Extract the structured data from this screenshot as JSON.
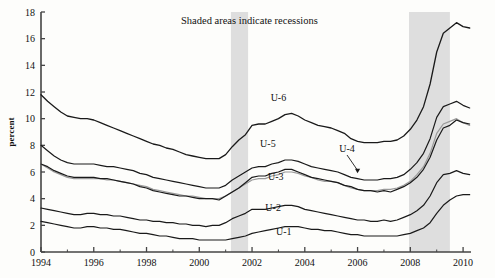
{
  "chart_data": {
    "type": "line",
    "title": "",
    "xlabel": "",
    "ylabel": "percent",
    "xlim": [
      1994.0,
      2010.3
    ],
    "ylim": [
      0,
      18
    ],
    "ytick_step": 2,
    "yticks": [
      0,
      2,
      4,
      6,
      8,
      10,
      12,
      14,
      16,
      18
    ],
    "xticks": [
      1994,
      1996,
      1998,
      2000,
      2002,
      2004,
      2006,
      2008,
      2010
    ],
    "xminor": [
      1995,
      1997,
      1999,
      2001,
      2003,
      2005,
      2007,
      2009
    ],
    "grid": false,
    "legend_position": "inline-labels",
    "annotations": [
      {
        "name": "recession-note",
        "text": "Shaded areas indicate recessions",
        "x": 2001.9,
        "y": 17.1
      },
      {
        "name": "label-u6",
        "text": "U-6",
        "x": 2003.0,
        "y": 11.3
      },
      {
        "name": "label-u5",
        "text": "U-5",
        "x": 2002.6,
        "y": 7.9
      },
      {
        "name": "label-u4",
        "text": "U-4",
        "x": 2005.6,
        "y": 7.5,
        "arrow_to": {
          "x": 2006.0,
          "y": 5.9
        }
      },
      {
        "name": "label-u3",
        "text": "U-3",
        "x": 2002.9,
        "y": 5.4
      },
      {
        "name": "label-u2",
        "text": "U-2",
        "x": 2002.8,
        "y": 3.1
      },
      {
        "name": "label-u1",
        "text": "U-1",
        "x": 2003.2,
        "y": 1.25
      }
    ],
    "shaded_regions": [
      {
        "name": "recession-2001",
        "x0": 2001.2,
        "x1": 2001.85,
        "color": "#dedede"
      },
      {
        "name": "recession-2008",
        "x0": 2007.95,
        "x1": 2009.5,
        "color": "#dedede"
      }
    ],
    "colors": {
      "dark_line": "#1a1a1a",
      "u4_line": "#9a9a9a",
      "shading": "#dedede",
      "axis": "#444444",
      "background": "#fdfdfb"
    },
    "x": [
      1994.0,
      1994.25,
      1994.5,
      1994.75,
      1995.0,
      1995.25,
      1995.5,
      1995.75,
      1996.0,
      1996.25,
      1996.5,
      1996.75,
      1997.0,
      1997.25,
      1997.5,
      1997.75,
      1998.0,
      1998.25,
      1998.5,
      1998.75,
      1999.0,
      1999.25,
      1999.5,
      1999.75,
      2000.0,
      2000.25,
      2000.5,
      2000.75,
      2001.0,
      2001.25,
      2001.5,
      2001.75,
      2002.0,
      2002.25,
      2002.5,
      2002.75,
      2003.0,
      2003.25,
      2003.5,
      2003.75,
      2004.0,
      2004.25,
      2004.5,
      2004.75,
      2005.0,
      2005.25,
      2005.5,
      2005.75,
      2006.0,
      2006.25,
      2006.5,
      2006.75,
      2007.0,
      2007.25,
      2007.5,
      2007.75,
      2008.0,
      2008.25,
      2008.5,
      2008.75,
      2009.0,
      2009.25,
      2009.5,
      2009.75,
      2010.0,
      2010.25
    ],
    "series": [
      {
        "name": "U-6",
        "label": "U-6",
        "color": "#1a1a1a",
        "width": 1.3,
        "values": [
          11.8,
          11.3,
          10.9,
          10.5,
          10.2,
          10.1,
          10.0,
          10.0,
          9.9,
          9.7,
          9.5,
          9.3,
          9.1,
          8.9,
          8.7,
          8.5,
          8.3,
          8.1,
          8.0,
          7.8,
          7.7,
          7.5,
          7.3,
          7.2,
          7.1,
          7.0,
          7.0,
          7.0,
          7.3,
          7.9,
          8.4,
          8.8,
          9.5,
          9.6,
          9.6,
          9.8,
          10.0,
          10.3,
          10.4,
          10.2,
          9.9,
          9.7,
          9.5,
          9.4,
          9.3,
          9.1,
          8.9,
          8.5,
          8.3,
          8.2,
          8.2,
          8.2,
          8.3,
          8.3,
          8.4,
          8.7,
          9.2,
          9.9,
          10.9,
          12.6,
          15.0,
          16.4,
          16.8,
          17.2,
          16.9,
          16.8
        ]
      },
      {
        "name": "U-5",
        "label": "U-5",
        "color": "#1a1a1a",
        "width": 1.2,
        "values": [
          8.0,
          7.6,
          7.2,
          6.9,
          6.7,
          6.6,
          6.6,
          6.6,
          6.6,
          6.5,
          6.4,
          6.4,
          6.3,
          6.2,
          6.1,
          5.9,
          5.8,
          5.6,
          5.5,
          5.4,
          5.3,
          5.2,
          5.1,
          5.0,
          4.9,
          4.8,
          4.8,
          4.8,
          5.0,
          5.4,
          5.7,
          6.0,
          6.3,
          6.4,
          6.4,
          6.6,
          6.7,
          6.9,
          6.9,
          6.8,
          6.6,
          6.4,
          6.3,
          6.2,
          6.1,
          6.0,
          5.8,
          5.6,
          5.5,
          5.4,
          5.4,
          5.4,
          5.5,
          5.5,
          5.6,
          5.8,
          6.2,
          6.7,
          7.4,
          8.5,
          10.1,
          10.9,
          11.1,
          11.3,
          11.0,
          10.8
        ]
      },
      {
        "name": "U-4",
        "label": "U-4",
        "color": "#9a9a9a",
        "width": 1.2,
        "values": [
          6.6,
          6.3,
          6.0,
          5.8,
          5.6,
          5.5,
          5.5,
          5.5,
          5.5,
          5.5,
          5.4,
          5.4,
          5.3,
          5.2,
          5.1,
          5.0,
          4.9,
          4.7,
          4.6,
          4.5,
          4.4,
          4.3,
          4.2,
          4.2,
          4.1,
          4.0,
          4.0,
          4.0,
          4.2,
          4.5,
          4.8,
          5.1,
          5.4,
          5.5,
          5.5,
          5.7,
          5.8,
          6.0,
          6.0,
          5.9,
          5.7,
          5.6,
          5.4,
          5.3,
          5.3,
          5.2,
          5.0,
          4.8,
          4.7,
          4.6,
          4.6,
          4.6,
          4.7,
          4.7,
          4.8,
          5.0,
          5.3,
          5.8,
          6.4,
          7.4,
          8.9,
          9.6,
          9.8,
          10.0,
          9.7,
          9.5
        ]
      },
      {
        "name": "U-3",
        "label": "U-3",
        "color": "#1a1a1a",
        "width": 1.2,
        "values": [
          6.6,
          6.4,
          6.1,
          5.9,
          5.7,
          5.6,
          5.6,
          5.6,
          5.6,
          5.5,
          5.5,
          5.4,
          5.3,
          5.2,
          5.1,
          4.9,
          4.8,
          4.6,
          4.5,
          4.4,
          4.3,
          4.2,
          4.2,
          4.1,
          4.0,
          4.0,
          4.0,
          3.9,
          4.2,
          4.5,
          4.8,
          5.2,
          5.6,
          5.7,
          5.7,
          5.9,
          6.0,
          6.2,
          6.2,
          6.0,
          5.8,
          5.6,
          5.5,
          5.4,
          5.3,
          5.2,
          5.0,
          4.9,
          4.7,
          4.6,
          4.6,
          4.5,
          4.6,
          4.5,
          4.7,
          4.9,
          5.2,
          5.6,
          6.2,
          7.1,
          8.4,
          9.3,
          9.5,
          9.9,
          9.7,
          9.6
        ]
      },
      {
        "name": "U-2",
        "label": "U-2",
        "color": "#1a1a1a",
        "width": 1.2,
        "values": [
          3.3,
          3.2,
          3.1,
          3.0,
          2.9,
          2.8,
          2.8,
          2.9,
          2.9,
          2.8,
          2.8,
          2.7,
          2.7,
          2.6,
          2.5,
          2.4,
          2.4,
          2.3,
          2.3,
          2.2,
          2.2,
          2.1,
          2.1,
          2.0,
          2.0,
          1.9,
          2.0,
          2.0,
          2.2,
          2.5,
          2.7,
          2.9,
          3.2,
          3.2,
          3.2,
          3.3,
          3.4,
          3.5,
          3.5,
          3.4,
          3.2,
          3.1,
          3.0,
          2.9,
          2.8,
          2.7,
          2.6,
          2.5,
          2.4,
          2.4,
          2.3,
          2.3,
          2.4,
          2.3,
          2.4,
          2.6,
          2.8,
          3.1,
          3.5,
          4.2,
          5.2,
          5.8,
          5.9,
          6.1,
          5.9,
          5.8
        ]
      },
      {
        "name": "U-1",
        "label": "U-1",
        "color": "#1a1a1a",
        "width": 1.2,
        "values": [
          2.3,
          2.2,
          2.1,
          2.0,
          1.9,
          1.8,
          1.8,
          1.9,
          1.9,
          1.8,
          1.8,
          1.7,
          1.7,
          1.6,
          1.5,
          1.4,
          1.4,
          1.3,
          1.2,
          1.2,
          1.1,
          1.0,
          1.0,
          1.0,
          0.9,
          0.9,
          0.9,
          0.9,
          0.9,
          1.0,
          1.1,
          1.2,
          1.4,
          1.5,
          1.6,
          1.7,
          1.8,
          1.9,
          1.9,
          1.9,
          1.8,
          1.7,
          1.7,
          1.6,
          1.6,
          1.5,
          1.4,
          1.3,
          1.3,
          1.2,
          1.2,
          1.2,
          1.2,
          1.2,
          1.2,
          1.3,
          1.4,
          1.6,
          1.8,
          2.2,
          2.9,
          3.5,
          3.9,
          4.2,
          4.3,
          4.3
        ]
      }
    ]
  }
}
